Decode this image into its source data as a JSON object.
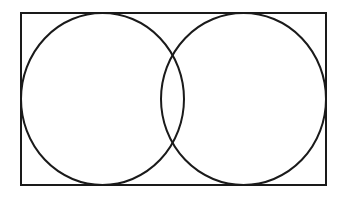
{
  "diagram": {
    "type": "venn",
    "set_count": 2,
    "sets": [
      {
        "label": ""
      },
      {
        "label": ""
      }
    ],
    "universe_label": "",
    "stroke_color": "#1a1a1a",
    "background": "#ffffff"
  }
}
